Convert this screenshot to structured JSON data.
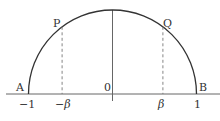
{
  "diagram": {
    "type": "semicircle-on-axis",
    "colors": {
      "curve": "#333333",
      "axis": "#666666",
      "dashed": "#777777",
      "text": "#333333"
    },
    "points": {
      "A": {
        "label": "A",
        "x": -1,
        "y": 0
      },
      "B": {
        "label": "B",
        "x": 1,
        "y": 0
      },
      "P": {
        "label": "P",
        "x": -0.6
      },
      "Q": {
        "label": "Q",
        "x": 0.6
      }
    },
    "ticks": [
      {
        "label": "−1",
        "value": -1
      },
      {
        "label": "−β",
        "value": -0.6
      },
      {
        "label": "0",
        "value": 0
      },
      {
        "label": "β",
        "value": 0.6
      },
      {
        "label": "1",
        "value": 1
      }
    ],
    "beta": 0.6
  }
}
